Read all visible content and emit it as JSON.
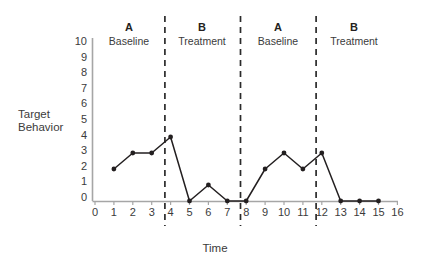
{
  "chart_data": {
    "type": "line",
    "title": "",
    "xlabel": "Time",
    "ylabel": "Target Behavior",
    "xlim": [
      0,
      16
    ],
    "ylim": [
      0,
      10
    ],
    "grid": false,
    "legend": "none",
    "x_ticks": [
      "0",
      "1",
      "2",
      "3",
      "4",
      "5",
      "6",
      "7",
      "8",
      "9",
      "10",
      "11",
      "12",
      "13",
      "14",
      "15",
      "16"
    ],
    "y_ticks": [
      "0",
      "1",
      "2",
      "3",
      "4",
      "5",
      "6",
      "7",
      "8",
      "9",
      "10"
    ],
    "x": [
      1,
      2,
      3,
      4,
      5,
      6,
      7,
      8,
      9,
      10,
      11,
      12,
      13,
      14,
      15
    ],
    "values": [
      2,
      3,
      3,
      4,
      0,
      1,
      0,
      0,
      2,
      3,
      2,
      3,
      0,
      0,
      0
    ],
    "series": [
      {
        "name": "Target Behavior",
        "values": [
          2,
          3,
          3,
          4,
          0,
          1,
          0,
          0,
          2,
          3,
          2,
          3,
          0,
          0,
          0
        ]
      }
    ],
    "phases": [
      {
        "letter": "A",
        "name": "Baseline",
        "x_start": 0.0,
        "x_end": 3.7
      },
      {
        "letter": "B",
        "name": "Treatment",
        "x_start": 3.7,
        "x_end": 7.7
      },
      {
        "letter": "A",
        "name": "Baseline",
        "x_start": 7.7,
        "x_end": 11.7
      },
      {
        "letter": "B",
        "name": "Treatment",
        "x_start": 11.7,
        "x_end": 16.0
      }
    ],
    "phase_dividers": [
      3.7,
      7.7,
      11.7
    ],
    "colors": {
      "line": "#231f20",
      "marker": "#231f20",
      "axis": "#a6a6a6",
      "divider": "#2b2b2b",
      "text": "#3b3b3b",
      "background": "#ffffff"
    }
  }
}
